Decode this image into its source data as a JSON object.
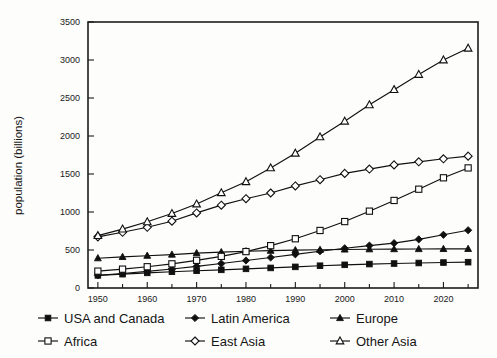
{
  "chart_data": {
    "type": "line",
    "title": "",
    "xlabel": "",
    "ylabel": "population (billions)",
    "xlim": [
      1948,
      1927
    ],
    "ylim": [
      0,
      3500
    ],
    "grid": false,
    "legend_position": "below-plot",
    "x": [
      1950,
      1955,
      1960,
      1965,
      1970,
      1975,
      1980,
      1985,
      1990,
      1995,
      2000,
      2005,
      2010,
      2015,
      2020,
      2025
    ],
    "x_tick_labels": [
      "1950",
      "1960",
      "1970",
      "1980",
      "1990",
      "2000",
      "2010",
      "2020"
    ],
    "x_ticks": [
      1950,
      1960,
      1970,
      1980,
      1990,
      2000,
      2010,
      2020
    ],
    "y_tick_labels": [
      "0",
      "500",
      "1000",
      "1500",
      "2000",
      "2500",
      "3000",
      "3500"
    ],
    "y_ticks": [
      0,
      500,
      1000,
      1500,
      2000,
      2500,
      3000,
      3500
    ],
    "series": [
      {
        "name": "USA and Canada",
        "marker": "filled-square",
        "values": [
          166,
          182,
          199,
          214,
          227,
          239,
          252,
          264,
          278,
          293,
          305,
          315,
          322,
          329,
          335,
          340
        ]
      },
      {
        "name": "Latin America",
        "marker": "filled-diamond",
        "values": [
          167,
          191,
          218,
          250,
          285,
          322,
          362,
          401,
          443,
          484,
          523,
          558,
          590,
          640,
          700,
          760
        ]
      },
      {
        "name": "Europe",
        "marker": "filled-triangle",
        "values": [
          392,
          409,
          425,
          440,
          459,
          472,
          484,
          491,
          498,
          503,
          507,
          510,
          512,
          513,
          514,
          515
        ]
      },
      {
        "name": "Africa",
        "marker": "open-square",
        "values": [
          222,
          248,
          280,
          318,
          364,
          416,
          479,
          557,
          648,
          757,
          874,
          1011,
          1152,
          1300,
          1450,
          1580
        ]
      },
      {
        "name": "East Asia",
        "marker": "open-diamond",
        "values": [
          673,
          733,
          799,
          879,
          988,
          1090,
          1175,
          1250,
          1343,
          1425,
          1508,
          1565,
          1620,
          1660,
          1700,
          1735
        ]
      },
      {
        "name": "Other Asia",
        "marker": "open-triangle",
        "values": [
          689,
          775,
          871,
          980,
          1105,
          1253,
          1398,
          1580,
          1773,
          1988,
          2195,
          2410,
          2610,
          2810,
          3000,
          3155
        ]
      }
    ]
  },
  "legend": {
    "entries": [
      {
        "label": "USA and Canada",
        "marker": "filled-square"
      },
      {
        "label": "Latin America",
        "marker": "filled-diamond"
      },
      {
        "label": "Europe",
        "marker": "filled-triangle"
      },
      {
        "label": "Africa",
        "marker": "open-square"
      },
      {
        "label": "East Asia",
        "marker": "open-diamond"
      },
      {
        "label": "Other Asia",
        "marker": "open-triangle"
      }
    ]
  },
  "colors": {
    "ink": "#101010",
    "frame": "#1c1c1c",
    "background": "#fdfdfc",
    "marker_fill_open": "#ffffff"
  }
}
